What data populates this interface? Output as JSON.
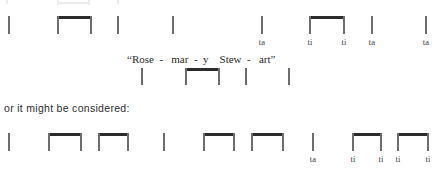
{
  "figure": {
    "title": "Rhythm notation example: Rosemary Stewart",
    "ink_color": "#2b2b2b",
    "stem_color": "#6d6d6d",
    "background": "#ffffff"
  },
  "top_artifacts": [
    {
      "left": 6,
      "top": 0,
      "width": 2,
      "height": 4
    },
    {
      "left": 57,
      "top": 2,
      "width": 33,
      "height": 2
    },
    {
      "left": 57,
      "top": 0,
      "width": 2,
      "height": 5
    },
    {
      "left": 88,
      "top": 0,
      "width": 2,
      "height": 5
    },
    {
      "left": 117,
      "top": 0,
      "width": 2,
      "height": 4
    }
  ],
  "staves": [
    {
      "id": "staff-upper",
      "baseline_top": 16,
      "stem_height": 18,
      "label_top": 37,
      "notes": [
        {
          "kind": "stem",
          "x": 8,
          "label": ""
        },
        {
          "kind": "beam",
          "x": 57,
          "x2": 90,
          "label_left": "",
          "label_right": ""
        },
        {
          "kind": "stem",
          "x": 117,
          "label": ""
        },
        {
          "kind": "stem",
          "x": 172,
          "label": ""
        },
        {
          "kind": "stem",
          "x": 261,
          "label": "ta"
        },
        {
          "kind": "beam",
          "x": 309,
          "x2": 343,
          "label_left": "ti",
          "label_right": "ti"
        },
        {
          "kind": "stem",
          "x": 371,
          "label": "ta"
        },
        {
          "kind": "stem",
          "x": 425,
          "label": "ta"
        }
      ]
    },
    {
      "id": "staff-middle",
      "baseline_top": 68,
      "stem_height": 17,
      "label_top": 0,
      "notes": [
        {
          "kind": "stem",
          "x": 141,
          "label": ""
        },
        {
          "kind": "beam",
          "x": 185,
          "x2": 218,
          "label_left": "",
          "label_right": ""
        },
        {
          "kind": "stem",
          "x": 245,
          "label": ""
        },
        {
          "kind": "stem",
          "x": 288,
          "label": ""
        }
      ]
    },
    {
      "id": "staff-lower",
      "baseline_top": 133,
      "stem_height": 18,
      "label_top": 154,
      "notes": [
        {
          "kind": "stem",
          "x": 8,
          "label": ""
        },
        {
          "kind": "beam",
          "x": 48,
          "x2": 80,
          "label_left": "",
          "label_right": ""
        },
        {
          "kind": "beam",
          "x": 98,
          "x2": 127,
          "label_left": "",
          "label_right": ""
        },
        {
          "kind": "stem",
          "x": 163,
          "label": ""
        },
        {
          "kind": "beam",
          "x": 203,
          "x2": 233,
          "label_left": "",
          "label_right": ""
        },
        {
          "kind": "beam",
          "x": 251,
          "x2": 282,
          "label_left": "",
          "label_right": ""
        },
        {
          "kind": "stem",
          "x": 312,
          "label": "ta"
        },
        {
          "kind": "beam",
          "x": 352,
          "x2": 380,
          "label_left": "ti",
          "label_right": "ti"
        },
        {
          "kind": "beam",
          "x": 397,
          "x2": 427,
          "label_left": "ti",
          "label_right": "ti"
        }
      ]
    }
  ],
  "lyric": {
    "text": "“Rose  -   mar  -  y    Stew  -   art”",
    "left": 127,
    "top": 53
  },
  "prose": {
    "text": "or it might be considered:",
    "left": 4,
    "top": 102
  }
}
